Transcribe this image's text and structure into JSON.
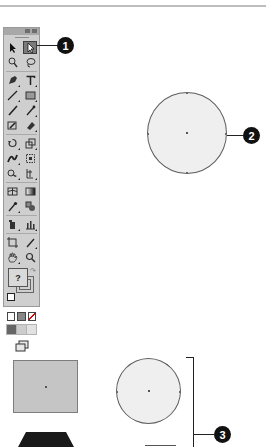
{
  "figure": {
    "colors": {
      "panel_bg": "#cfcfcf",
      "active_tool_bg": "#7b7b7b",
      "callout_bg": "#111111",
      "shape_fill_light": "#efefef",
      "shape_fill_rect": "#c5c5c5",
      "shape_fill_dark": "#1a1a1a"
    }
  },
  "toolbar": {
    "tools": [
      {
        "id": "selection",
        "icon": "arrow-icon"
      },
      {
        "id": "direct-selection",
        "icon": "direct-selection-icon",
        "active": true
      },
      {
        "id": "magic-wand",
        "icon": "magic-wand-icon"
      },
      {
        "id": "lasso",
        "icon": "lasso-icon"
      },
      {
        "id": "pen",
        "icon": "pen-icon"
      },
      {
        "id": "type",
        "icon": "type-icon",
        "glyph": "T"
      },
      {
        "id": "line-segment",
        "icon": "line-icon"
      },
      {
        "id": "rectangle",
        "icon": "rectangle-icon"
      },
      {
        "id": "paintbrush",
        "icon": "paintbrush-icon"
      },
      {
        "id": "pencil",
        "icon": "pencil-icon"
      },
      {
        "id": "blob-brush",
        "icon": "blob-brush-icon"
      },
      {
        "id": "eraser",
        "icon": "eraser-icon"
      },
      {
        "id": "rotate",
        "icon": "rotate-icon"
      },
      {
        "id": "scale",
        "icon": "scale-icon"
      },
      {
        "id": "width",
        "icon": "width-icon"
      },
      {
        "id": "free-transform",
        "icon": "free-transform-icon"
      },
      {
        "id": "shape-builder",
        "icon": "shape-builder-icon"
      },
      {
        "id": "perspective-grid",
        "icon": "perspective-grid-icon"
      },
      {
        "id": "mesh",
        "icon": "mesh-icon"
      },
      {
        "id": "gradient",
        "icon": "gradient-icon"
      },
      {
        "id": "eyedropper",
        "icon": "eyedropper-icon"
      },
      {
        "id": "blend",
        "icon": "blend-icon"
      },
      {
        "id": "symbol-sprayer",
        "icon": "symbol-sprayer-icon"
      },
      {
        "id": "column-graph",
        "icon": "column-graph-icon"
      },
      {
        "id": "artboard",
        "icon": "artboard-icon"
      },
      {
        "id": "slice",
        "icon": "slice-icon"
      },
      {
        "id": "hand",
        "icon": "hand-icon"
      },
      {
        "id": "zoom",
        "icon": "zoom-icon"
      }
    ],
    "fill_label": "?"
  },
  "callouts": [
    {
      "number": "1"
    },
    {
      "number": "2"
    },
    {
      "number": "3"
    }
  ]
}
